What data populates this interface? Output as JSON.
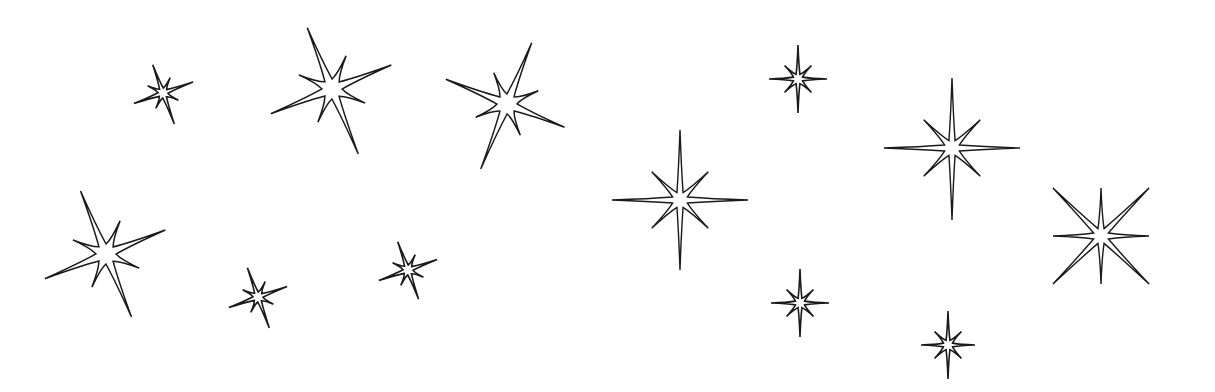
{
  "scene": {
    "description": "Line-art sparkles: twelve eight-pointed outline stars on a white background",
    "background_color": "#ffffff",
    "stroke_color": "#1a1a1a",
    "star_count": 12,
    "stars": [
      {
        "id": "star-1",
        "style": "tilted",
        "size": "small"
      },
      {
        "id": "star-2",
        "style": "tilted",
        "size": "large"
      },
      {
        "id": "star-3",
        "style": "tilted",
        "size": "large"
      },
      {
        "id": "star-4",
        "style": "tilted",
        "size": "large"
      },
      {
        "id": "star-5",
        "style": "tilted",
        "size": "small"
      },
      {
        "id": "star-6",
        "style": "tilted",
        "size": "small"
      },
      {
        "id": "star-7",
        "style": "upright",
        "size": "large"
      },
      {
        "id": "star-8",
        "style": "upright",
        "size": "small"
      },
      {
        "id": "star-9",
        "style": "upright",
        "size": "large"
      },
      {
        "id": "star-10",
        "style": "diagonal",
        "size": "large"
      },
      {
        "id": "star-11",
        "style": "upright",
        "size": "small"
      },
      {
        "id": "star-12",
        "style": "upright",
        "size": "small"
      }
    ]
  }
}
